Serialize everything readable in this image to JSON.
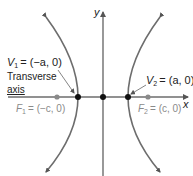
{
  "diagram": {
    "type": "hyperbola",
    "axes": {
      "x_label": "x",
      "y_label": "y"
    },
    "vertices": [
      {
        "id": "V1",
        "label": "V",
        "sub": "1",
        "coord": "= (−a, 0)"
      },
      {
        "id": "V2",
        "label": "V",
        "sub": "2",
        "coord": "= (a, 0)"
      }
    ],
    "foci": [
      {
        "id": "F1",
        "label": "F",
        "sub": "1",
        "coord": "= (−c, 0)"
      },
      {
        "id": "F2",
        "label": "F",
        "sub": "2",
        "coord": "= (c, 0)"
      }
    ],
    "annotation": {
      "line1": "Transverse",
      "line2": "axis"
    },
    "colors": {
      "curve": "#6d6d6d",
      "axis": "#6d6d6d",
      "vertex": "#111111",
      "focus": "#8a8a8a",
      "focus_text": "#8a8a8a",
      "text": "#222222"
    }
  }
}
